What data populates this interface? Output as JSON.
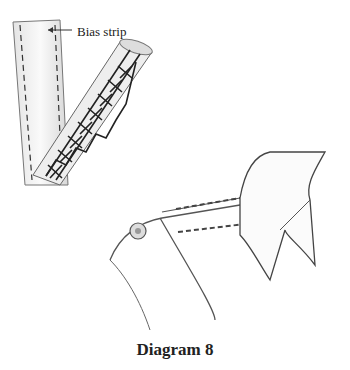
{
  "diagram": {
    "callout_label": "Bias strip",
    "caption": "Diagram 8",
    "parts": [
      "bias-strip",
      "cross-stitched-strip",
      "shirt-collar",
      "collar-band",
      "button"
    ]
  }
}
